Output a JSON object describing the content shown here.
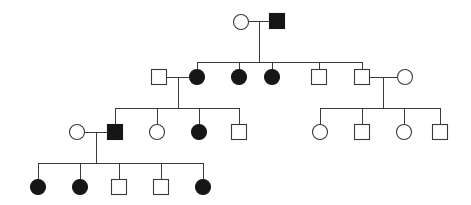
{
  "figure": {
    "kind": "pedigree-chart",
    "title": "",
    "caption": "",
    "background_color": "#ffffff",
    "line_color": "#3a3a3a",
    "affected_fill_color": "#161616",
    "unaffected_fill_color": "#ffffff",
    "symbol_key": {
      "circle": "female",
      "square": "male",
      "filled": "affected",
      "open": "unaffected"
    },
    "generation_count": 4,
    "individual_count": 27
  },
  "chart_data": {
    "type": "diagram",
    "title": "",
    "generations": [
      {
        "label": "I",
        "y": 22,
        "individuals": [
          {
            "id": "I-1",
            "sex": "female",
            "shape": "circle",
            "status": "unaffected",
            "filled": false,
            "x": 241,
            "y": 22
          },
          {
            "id": "I-2",
            "sex": "male",
            "shape": "square",
            "status": "affected",
            "filled": true,
            "x": 277,
            "y": 21
          }
        ],
        "matings": [
          {
            "partners": [
              "I-1",
              "I-2"
            ],
            "y": 22,
            "children": [
              "II-2",
              "II-3",
              "II-4",
              "II-5",
              "II-6"
            ]
          }
        ]
      },
      {
        "label": "II",
        "y": 77,
        "individuals": [
          {
            "id": "II-1",
            "sex": "male",
            "shape": "square",
            "status": "unaffected",
            "filled": false,
            "x": 159,
            "y": 77,
            "married_in": true
          },
          {
            "id": "II-2",
            "sex": "female",
            "shape": "circle",
            "status": "affected",
            "filled": true,
            "x": 197,
            "y": 77
          },
          {
            "id": "II-3",
            "sex": "female",
            "shape": "circle",
            "status": "affected",
            "filled": true,
            "x": 239,
            "y": 77
          },
          {
            "id": "II-4",
            "sex": "female",
            "shape": "circle",
            "status": "affected",
            "filled": true,
            "x": 272,
            "y": 77
          },
          {
            "id": "II-5",
            "sex": "male",
            "shape": "square",
            "status": "unaffected",
            "filled": false,
            "x": 319,
            "y": 77
          },
          {
            "id": "II-6",
            "sex": "male",
            "shape": "square",
            "status": "unaffected",
            "filled": false,
            "x": 362,
            "y": 77
          },
          {
            "id": "II-7",
            "sex": "female",
            "shape": "circle",
            "status": "unaffected",
            "filled": false,
            "x": 405,
            "y": 77,
            "married_in": true
          }
        ],
        "matings": [
          {
            "partners": [
              "II-1",
              "II-2"
            ],
            "y": 77,
            "children": [
              "III-2",
              "III-3",
              "III-4",
              "III-5"
            ]
          },
          {
            "partners": [
              "II-6",
              "II-7"
            ],
            "y": 77,
            "children": [
              "III-6",
              "III-7",
              "III-8",
              "III-9"
            ]
          }
        ]
      },
      {
        "label": "III",
        "y": 132,
        "individuals": [
          {
            "id": "III-1",
            "sex": "female",
            "shape": "circle",
            "status": "unaffected",
            "filled": false,
            "x": 77,
            "y": 132,
            "married_in": true
          },
          {
            "id": "III-2",
            "sex": "male",
            "shape": "square",
            "status": "affected",
            "filled": true,
            "x": 115,
            "y": 132
          },
          {
            "id": "III-3",
            "sex": "female",
            "shape": "circle",
            "status": "unaffected",
            "filled": false,
            "x": 157,
            "y": 132
          },
          {
            "id": "III-4",
            "sex": "female",
            "shape": "circle",
            "status": "affected",
            "filled": true,
            "x": 199,
            "y": 132
          },
          {
            "id": "III-5",
            "sex": "male",
            "shape": "square",
            "status": "unaffected",
            "filled": false,
            "x": 239,
            "y": 132
          },
          {
            "id": "III-6",
            "sex": "female",
            "shape": "circle",
            "status": "unaffected",
            "filled": false,
            "x": 320,
            "y": 132
          },
          {
            "id": "III-7",
            "sex": "male",
            "shape": "square",
            "status": "unaffected",
            "filled": false,
            "x": 362,
            "y": 132
          },
          {
            "id": "III-8",
            "sex": "female",
            "shape": "circle",
            "status": "unaffected",
            "filled": false,
            "x": 404,
            "y": 132
          },
          {
            "id": "III-9",
            "sex": "male",
            "shape": "square",
            "status": "unaffected",
            "filled": false,
            "x": 440,
            "y": 132
          }
        ],
        "matings": [
          {
            "partners": [
              "III-1",
              "III-2"
            ],
            "y": 132,
            "children": [
              "IV-1",
              "IV-2",
              "IV-3",
              "IV-4",
              "IV-5"
            ]
          }
        ]
      },
      {
        "label": "IV",
        "y": 187,
        "individuals": [
          {
            "id": "IV-1",
            "sex": "female",
            "shape": "circle",
            "status": "affected",
            "filled": true,
            "x": 38,
            "y": 187
          },
          {
            "id": "IV-2",
            "sex": "female",
            "shape": "circle",
            "status": "affected",
            "filled": true,
            "x": 80,
            "y": 187
          },
          {
            "id": "IV-3",
            "sex": "male",
            "shape": "square",
            "status": "unaffected",
            "filled": false,
            "x": 119,
            "y": 187
          },
          {
            "id": "IV-4",
            "sex": "male",
            "shape": "square",
            "status": "unaffected",
            "filled": false,
            "x": 161,
            "y": 187
          },
          {
            "id": "IV-5",
            "sex": "female",
            "shape": "circle",
            "status": "affected",
            "filled": true,
            "x": 203,
            "y": 187
          }
        ],
        "matings": []
      }
    ],
    "counts": {
      "affected_total": 10,
      "affected_females": 8,
      "affected_males": 2,
      "unaffected_total": 17,
      "females_total": 14,
      "males_total": 13
    }
  }
}
